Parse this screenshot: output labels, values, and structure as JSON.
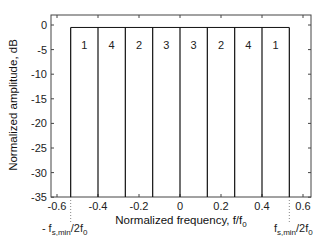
{
  "chart_data": {
    "type": "line",
    "title": "",
    "xlabel": "Normalized frequency, f/f0",
    "xlabel_main": "Normalized frequency, f/f",
    "xlabel_sub": "0",
    "ylabel": "Normalized amplitude, dB",
    "xlim": [
      -0.63,
      0.65
    ],
    "ylim": [
      -35,
      2
    ],
    "grid": false,
    "legend": null,
    "x_ticks": [
      -0.6,
      -0.4,
      -0.2,
      0,
      0.2,
      0.4,
      0.6
    ],
    "x_tick_labels": [
      "-0.6",
      "-0.4",
      "-0.2",
      "0",
      "0.2",
      "0.4",
      "0.6"
    ],
    "y_ticks": [
      0,
      -5,
      -10,
      -15,
      -20,
      -25,
      -30,
      -35
    ],
    "y_tick_labels": [
      "0",
      "-5",
      "-10",
      "-15",
      "-20",
      "-25",
      "-30",
      "-35"
    ],
    "passband_level_db": -0.5,
    "band_edges": [
      -0.5333,
      -0.4,
      -0.2667,
      -0.1333,
      0,
      0.1333,
      0.2667,
      0.4,
      0.5333
    ],
    "band_labels": [
      "1",
      "4",
      "2",
      "3",
      "3",
      "2",
      "4",
      "1"
    ],
    "markers": [
      {
        "x": -0.5333,
        "style": "dotted",
        "label_prefix": "- f",
        "label_sub": "s,min",
        "label_suffix": "/2f",
        "label_sub2": "0"
      },
      {
        "x": 0.5333,
        "style": "dotted",
        "label_prefix": "f",
        "label_sub": "s,min",
        "label_suffix": "/2f",
        "label_sub2": "0"
      }
    ]
  },
  "colors": {
    "axis": "#444444",
    "line": "#111111",
    "dotted": "#888888"
  }
}
